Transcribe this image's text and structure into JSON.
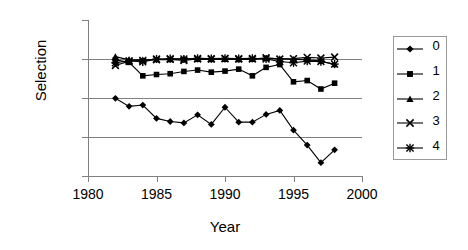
{
  "chart_data": {
    "type": "line",
    "title": "",
    "xlabel": "Year",
    "ylabel": "Selection",
    "yscale": "log",
    "ylim": [
      0.001,
      10.0
    ],
    "xlim": [
      1980,
      2000
    ],
    "grid": true,
    "legend_position": "right",
    "ytick_labels": [
      "10.0",
      "1.0",
      "0.1",
      "0.01",
      "0.001"
    ],
    "ytick_values": [
      10.0,
      1.0,
      0.1,
      0.01,
      0.001
    ],
    "xtick_labels": [
      "1980",
      "1985",
      "1990",
      "1995",
      "2000"
    ],
    "xtick_values": [
      1980,
      1985,
      1990,
      1995,
      2000
    ],
    "x": [
      1982,
      1983,
      1984,
      1985,
      1986,
      1987,
      1988,
      1989,
      1990,
      1991,
      1992,
      1993,
      1994,
      1995,
      1996,
      1997,
      1998
    ],
    "series": [
      {
        "name": "0",
        "marker": "diamond",
        "values": [
          0.098,
          0.061,
          0.066,
          0.03,
          0.025,
          0.023,
          0.037,
          0.021,
          0.058,
          0.024,
          0.024,
          0.038,
          0.048,
          0.015,
          0.0062,
          0.0022,
          0.0047
        ]
      },
      {
        "name": "1",
        "marker": "square",
        "values": [
          0.95,
          0.82,
          0.37,
          0.4,
          0.42,
          0.48,
          0.52,
          0.46,
          0.49,
          0.55,
          0.37,
          0.61,
          0.72,
          0.26,
          0.28,
          0.17,
          0.24
        ]
      },
      {
        "name": "2",
        "marker": "triangle",
        "values": [
          1.15,
          0.95,
          0.95,
          0.97,
          0.97,
          1.02,
          0.98,
          0.97,
          0.99,
          0.97,
          0.98,
          1.04,
          1.02,
          0.98,
          0.96,
          0.88,
          0.72
        ]
      },
      {
        "name": "3",
        "marker": "cross",
        "values": [
          0.68,
          0.88,
          0.92,
          0.96,
          0.98,
          0.92,
          1.0,
          1.0,
          1.02,
          1.0,
          1.0,
          1.08,
          1.0,
          1.02,
          1.1,
          1.06,
          1.12
        ]
      },
      {
        "name": "4",
        "marker": "asterisk",
        "values": [
          0.8,
          0.9,
          0.84,
          1.0,
          1.02,
          1.0,
          1.04,
          1.02,
          1.04,
          1.02,
          1.04,
          1.0,
          0.86,
          0.8,
          0.88,
          0.86,
          0.74
        ]
      }
    ]
  }
}
